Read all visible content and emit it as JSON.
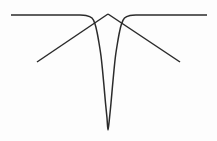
{
  "figure": {
    "title": "",
    "background_color": "#fdfdfd",
    "width": 217,
    "height": 141
  },
  "chart_data": {
    "type": "line",
    "title": "",
    "subtitle": "",
    "xlabel": "",
    "ylabel": "",
    "xlim": [
      0,
      217
    ],
    "ylim": [
      141,
      0
    ],
    "grid": false,
    "legend": null,
    "axes_visible": false,
    "tick_labels": {
      "x": [],
      "y": []
    },
    "annotations": [],
    "series": [
      {
        "name": "notch-curve",
        "description": "Flat baseline that bends downward into a deep narrow V-shaped notch and returns to baseline",
        "color": "#2b2b2b",
        "line_width": 1.5,
        "line_style": "solid",
        "marker": "none",
        "points": [
          [
            11,
            15
          ],
          [
            40,
            15
          ],
          [
            60,
            15
          ],
          [
            78,
            15
          ],
          [
            86,
            15.5
          ],
          [
            92,
            18
          ],
          [
            95,
            24
          ],
          [
            97,
            32
          ],
          [
            99,
            43
          ],
          [
            101,
            56
          ],
          [
            102.5,
            70
          ],
          [
            104,
            86
          ],
          [
            105.5,
            103
          ],
          [
            107,
            118
          ],
          [
            108,
            130
          ],
          [
            109.5,
            118
          ],
          [
            111,
            103
          ],
          [
            112.5,
            86
          ],
          [
            114,
            70
          ],
          [
            115.5,
            56
          ],
          [
            117.5,
            43
          ],
          [
            119.5,
            32
          ],
          [
            121.5,
            24
          ],
          [
            124.5,
            18
          ],
          [
            130,
            15.5
          ],
          [
            138,
            15
          ],
          [
            160,
            15
          ],
          [
            185,
            15
          ],
          [
            207,
            15
          ]
        ]
      },
      {
        "name": "peak-line-left",
        "description": "Straight diagonal rising from lower-left to the central apex",
        "color": "#2b2b2b",
        "line_width": 1.5,
        "line_style": "solid",
        "marker": "none",
        "points": [
          [
            37,
            62
          ],
          [
            108,
            14
          ]
        ]
      },
      {
        "name": "peak-line-right",
        "description": "Straight diagonal descending from the central apex to the lower-right",
        "color": "#2b2b2b",
        "line_width": 1.5,
        "line_style": "solid",
        "marker": "none",
        "points": [
          [
            108,
            14
          ],
          [
            180,
            62
          ]
        ]
      }
    ],
    "features": {
      "baseline_y": 15,
      "notch_min_y": 130,
      "notch_center_x": 108,
      "apex_x": 108,
      "apex_y": 14
    }
  }
}
